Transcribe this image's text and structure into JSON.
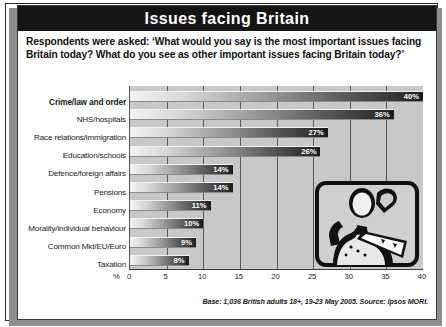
{
  "header": {
    "title": "Issues facing Britain"
  },
  "question": {
    "text": "Respondents were asked: ‘What would you say is the most important issues facing Britain today? What do you see as other important issues facing Britain today?’"
  },
  "footer": {
    "text": "Base: 1,036 British adults 18+, 19-23 May 2005. Source: Ipsos MORI."
  },
  "axis": {
    "unit_symbol": "%",
    "ticks": [
      "0",
      "5",
      "10",
      "15",
      "20",
      "25",
      "30",
      "35",
      "40"
    ]
  },
  "illustration": {
    "name": "worker-with-saw-illustration"
  },
  "chart_data": {
    "type": "bar",
    "orientation": "horizontal",
    "title": "Issues facing Britain",
    "xlabel": "%",
    "ylabel": "",
    "xlim": [
      0,
      40
    ],
    "xticks": [
      0,
      5,
      10,
      15,
      20,
      25,
      30,
      35,
      40
    ],
    "grid": true,
    "legend": false,
    "categories": [
      "Crime/law and order",
      "NHS/hospitals",
      "Race relations/immigration",
      "Education/schools",
      "Defence/foreign affairs",
      "Pensions",
      "Economy",
      "Morality/individual behaviour",
      "Common Mkt/EU/Euro",
      "Taxation"
    ],
    "values": [
      40,
      36,
      27,
      26,
      14,
      14,
      11,
      10,
      9,
      8
    ],
    "labels": [
      "40%",
      "36%",
      "27%",
      "26%",
      "14%",
      "14%",
      "11%",
      "10%",
      "9%",
      "8%"
    ],
    "emphasis_index": 0
  },
  "colors": {
    "title_bar": "#141414",
    "title_text": "#ffffff",
    "plot_background": "#c8c8c8",
    "bar_light": "#f4f4f4",
    "bar_dark": "#1c1c1c",
    "gridline": "#5a5a5a"
  }
}
